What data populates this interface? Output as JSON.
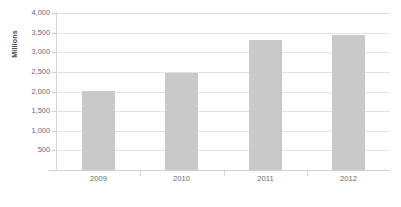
{
  "chart_data": {
    "type": "bar",
    "title": "",
    "subtitle": "",
    "xlabel": "",
    "ylabel": "Millions",
    "categories": [
      "2009",
      "2010",
      "2011",
      "2012"
    ],
    "values": [
      2000,
      2470,
      3300,
      3430
    ],
    "series": [
      {
        "name": "",
        "values": [
          2000,
          2470,
          3300,
          3430
        ]
      }
    ],
    "ylim": [
      0,
      4000
    ],
    "ytick_values": [
      0,
      500,
      1000,
      1500,
      2000,
      2500,
      3000,
      3500,
      4000
    ],
    "ytick_labels": [
      "-",
      "500",
      "1,000",
      "1,500",
      "2,000",
      "2,500",
      "3,000",
      "3,500",
      "4,000"
    ],
    "grid": true,
    "grid_axis": "y",
    "legend": false,
    "legend_position": "none",
    "bar_color": "#c9c9c9",
    "gridline_color": "#e3e3e3",
    "axis_line_color": "#d5d5d5",
    "tick_label_color": "#6b6b6b",
    "background_color": "#ffffff",
    "annotations": []
  },
  "caption": {
    "text": ""
  }
}
